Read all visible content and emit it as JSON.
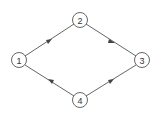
{
  "diagram": {
    "type": "directed-graph",
    "colors": {
      "stroke": "#555555",
      "background": "#ffffff",
      "text": "#333333"
    },
    "nodes": [
      {
        "id": "1",
        "label": "1",
        "x": 19,
        "y": 60
      },
      {
        "id": "2",
        "label": "2",
        "x": 80,
        "y": 20
      },
      {
        "id": "3",
        "label": "3",
        "x": 142,
        "y": 60
      },
      {
        "id": "4",
        "label": "4",
        "x": 80,
        "y": 100
      }
    ],
    "edges": [
      {
        "from": "1",
        "to": "2"
      },
      {
        "from": "2",
        "to": "3"
      },
      {
        "from": "4",
        "to": "1"
      },
      {
        "from": "4",
        "to": "3"
      }
    ]
  }
}
